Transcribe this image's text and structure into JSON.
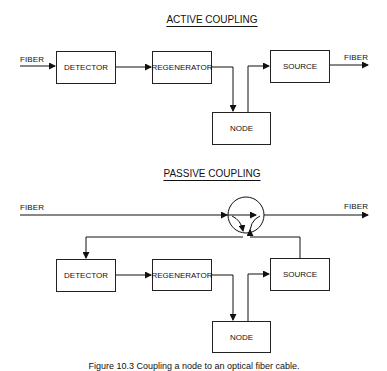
{
  "active": {
    "title": "ACTIVE COUPLING",
    "fiber_in": "FIBER",
    "fiber_out": "FIBER",
    "blocks": {
      "detector": "DETECTOR",
      "regenerator": "REGENERATOR",
      "source": "SOURCE",
      "node": "NODE"
    }
  },
  "passive": {
    "title": "PASSIVE COUPLING",
    "fiber_in": "FIBER",
    "fiber_out": "FIBER",
    "blocks": {
      "detector": "DETECTOR",
      "regenerator": "REGENERATOR",
      "source": "SOURCE",
      "node": "NODE"
    }
  },
  "caption": "Figure 10.3  Coupling a node to an optical fiber cable."
}
